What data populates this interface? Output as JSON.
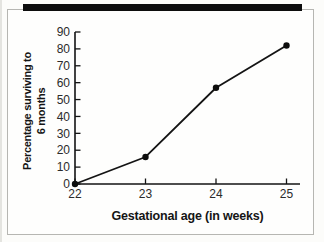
{
  "figure": {
    "background": "#fcfcfa",
    "frame_border_color": "#b6b6b2",
    "top_bar_color": "#0d0d0d",
    "line_color": "#141414",
    "marker_color": "#0d0d0d",
    "tick_label_color": "#2b2b2b"
  },
  "chart_data": {
    "type": "line",
    "title": "",
    "xlabel": "Gestational age (in weeks)",
    "ylabel": "Percentage surviving to 6 months",
    "ylabel_lines": [
      "Percentage surviving to",
      "6 months"
    ],
    "x": [
      22,
      23,
      24,
      25
    ],
    "values": [
      0,
      16,
      57,
      82
    ],
    "series_name": "Percentage surviving to 6 months",
    "xticks": [
      22,
      23,
      24,
      25
    ],
    "yticks": [
      0,
      10,
      20,
      30,
      40,
      50,
      60,
      70,
      80,
      90
    ],
    "xlim": [
      22,
      25
    ],
    "ylim": [
      0,
      90
    ],
    "grid": false,
    "legend": null,
    "marker": "circle"
  }
}
